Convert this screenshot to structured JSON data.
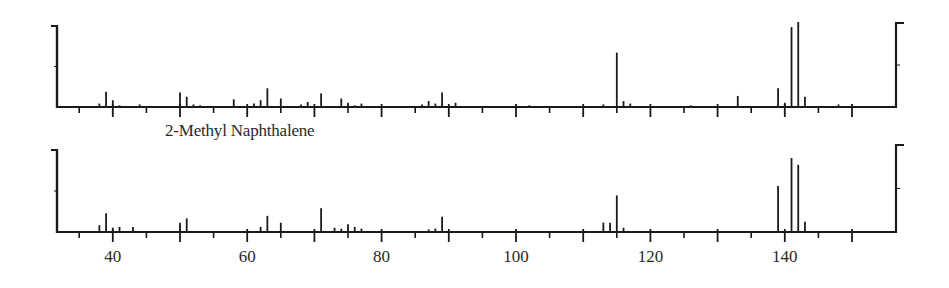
{
  "chart_data": [
    {
      "type": "bar",
      "subtype": "mass-spectrum-stick",
      "title": "",
      "panel": "upper",
      "xlabel": "",
      "ylabel": "",
      "xlim": [
        31,
        156
      ],
      "ylim": [
        0,
        100
      ],
      "x_ticks_major": [
        40,
        50,
        60,
        70,
        80,
        90,
        100,
        110,
        120,
        130,
        140,
        150
      ],
      "x_ticks_minor": [
        35,
        45,
        55,
        65,
        75,
        85,
        95,
        105,
        115,
        125,
        135,
        145
      ],
      "x_tick_labels_shown": false,
      "grid": false,
      "peaks": [
        {
          "mz": 38,
          "intensity": 4
        },
        {
          "mz": 39,
          "intensity": 18
        },
        {
          "mz": 40,
          "intensity": 8
        },
        {
          "mz": 41,
          "intensity": 2
        },
        {
          "mz": 44,
          "intensity": 3
        },
        {
          "mz": 50,
          "intensity": 17
        },
        {
          "mz": 51,
          "intensity": 12
        },
        {
          "mz": 52,
          "intensity": 3
        },
        {
          "mz": 53,
          "intensity": 2
        },
        {
          "mz": 58,
          "intensity": 9
        },
        {
          "mz": 61,
          "intensity": 4
        },
        {
          "mz": 62,
          "intensity": 8
        },
        {
          "mz": 63,
          "intensity": 22
        },
        {
          "mz": 65,
          "intensity": 10
        },
        {
          "mz": 68,
          "intensity": 3
        },
        {
          "mz": 69,
          "intensity": 6
        },
        {
          "mz": 71,
          "intensity": 16
        },
        {
          "mz": 74,
          "intensity": 10
        },
        {
          "mz": 75,
          "intensity": 5
        },
        {
          "mz": 76,
          "intensity": 2
        },
        {
          "mz": 77,
          "intensity": 4
        },
        {
          "mz": 86,
          "intensity": 3
        },
        {
          "mz": 87,
          "intensity": 7
        },
        {
          "mz": 88,
          "intensity": 4
        },
        {
          "mz": 89,
          "intensity": 17
        },
        {
          "mz": 91,
          "intensity": 5
        },
        {
          "mz": 102,
          "intensity": 2
        },
        {
          "mz": 113,
          "intensity": 3
        },
        {
          "mz": 115,
          "intensity": 64
        },
        {
          "mz": 116,
          "intensity": 7
        },
        {
          "mz": 117,
          "intensity": 4
        },
        {
          "mz": 126,
          "intensity": 2
        },
        {
          "mz": 133,
          "intensity": 13
        },
        {
          "mz": 139,
          "intensity": 22
        },
        {
          "mz": 140,
          "intensity": 5
        },
        {
          "mz": 141,
          "intensity": 94
        },
        {
          "mz": 142,
          "intensity": 100
        },
        {
          "mz": 143,
          "intensity": 12
        },
        {
          "mz": 148,
          "intensity": 3
        }
      ]
    },
    {
      "type": "bar",
      "subtype": "mass-spectrum-stick",
      "title": "2-Methyl Naphthalene",
      "panel": "lower",
      "xlabel": "",
      "ylabel": "",
      "xlim": [
        31,
        156
      ],
      "ylim": [
        0,
        100
      ],
      "x_ticks_major": [
        40,
        50,
        60,
        70,
        80,
        90,
        100,
        110,
        120,
        130,
        140,
        150
      ],
      "x_ticks_minor": [
        35,
        45,
        55,
        65,
        75,
        85,
        95,
        105,
        115,
        125,
        135,
        145
      ],
      "x_tick_labels": [
        "40",
        "60",
        "80",
        "100",
        "120",
        "140"
      ],
      "grid": false,
      "peaks": [
        {
          "mz": 38,
          "intensity": 8
        },
        {
          "mz": 39,
          "intensity": 22
        },
        {
          "mz": 40,
          "intensity": 5
        },
        {
          "mz": 41,
          "intensity": 6
        },
        {
          "mz": 43,
          "intensity": 6
        },
        {
          "mz": 50,
          "intensity": 11
        },
        {
          "mz": 51,
          "intensity": 16
        },
        {
          "mz": 62,
          "intensity": 6
        },
        {
          "mz": 63,
          "intensity": 19
        },
        {
          "mz": 65,
          "intensity": 11
        },
        {
          "mz": 71,
          "intensity": 28
        },
        {
          "mz": 73,
          "intensity": 5
        },
        {
          "mz": 74,
          "intensity": 4
        },
        {
          "mz": 75,
          "intensity": 9
        },
        {
          "mz": 76,
          "intensity": 6
        },
        {
          "mz": 77,
          "intensity": 4
        },
        {
          "mz": 87,
          "intensity": 3
        },
        {
          "mz": 88,
          "intensity": 4
        },
        {
          "mz": 89,
          "intensity": 18
        },
        {
          "mz": 113,
          "intensity": 11
        },
        {
          "mz": 114,
          "intensity": 11
        },
        {
          "mz": 115,
          "intensity": 43
        },
        {
          "mz": 116,
          "intensity": 5
        },
        {
          "mz": 139,
          "intensity": 54
        },
        {
          "mz": 141,
          "intensity": 87
        },
        {
          "mz": 142,
          "intensity": 79
        },
        {
          "mz": 143,
          "intensity": 12
        }
      ]
    }
  ],
  "labels": {
    "compound": "2-Methyl Naphthalene"
  },
  "layout": {
    "px_per_unit": 6.72,
    "x_zero": -156,
    "panels": [
      {
        "left": 57,
        "right": 896,
        "top_left": 26,
        "top_right": 23,
        "baseline": 107,
        "full_height": 85
      },
      {
        "left": 57,
        "right": 896,
        "top_left": 150,
        "top_right": 145,
        "baseline": 232,
        "full_height": 85
      }
    ],
    "tick_label_y": 262,
    "line_color": "#1a1a1a"
  }
}
